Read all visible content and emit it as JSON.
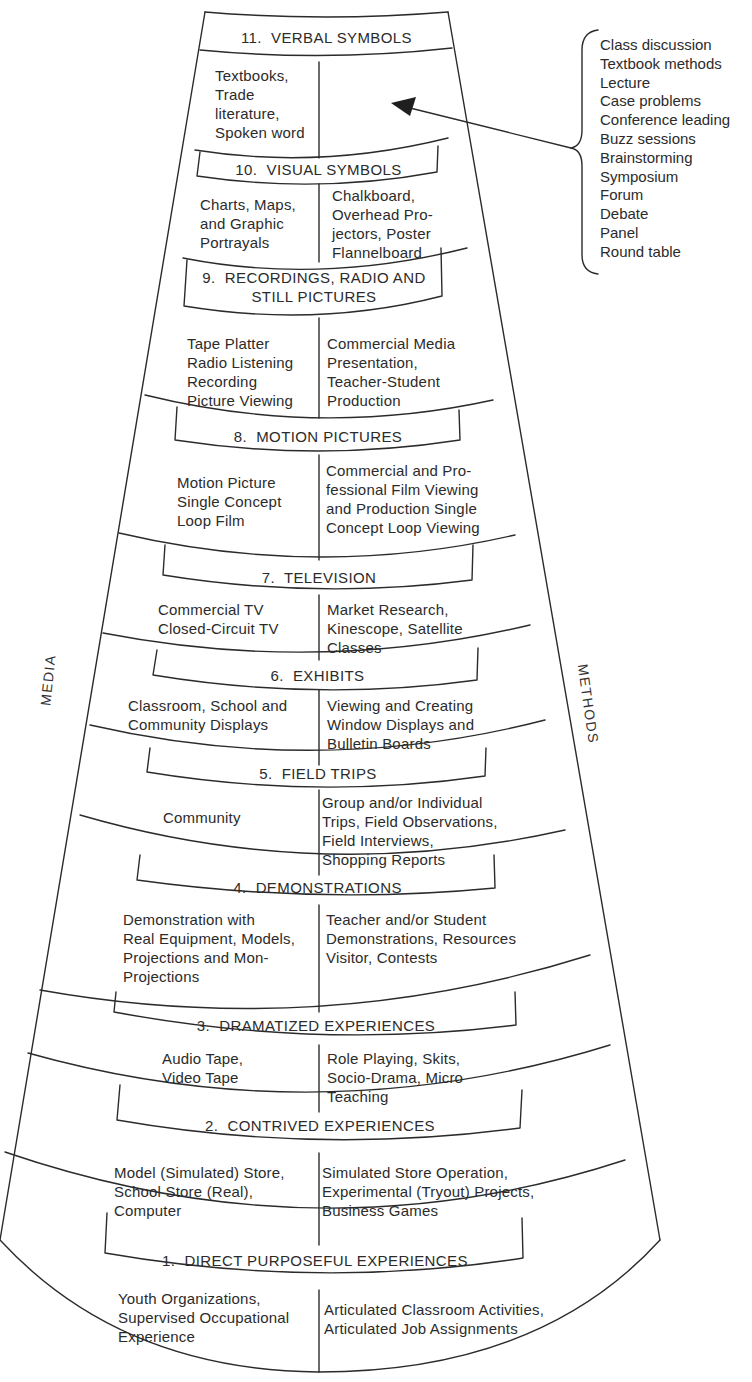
{
  "side_labels": {
    "left": "MEDIA",
    "right": "METHODS"
  },
  "verbal_methods": [
    "Class discussion",
    "Textbook methods",
    "Lecture",
    "Case problems",
    "Conference leading",
    "Buzz sessions",
    "Brainstorming",
    "Symposium",
    "Forum",
    "Debate",
    "Panel",
    "Round table"
  ],
  "levels": {
    "l11": {
      "title": "11.  VERBAL SYMBOLS",
      "media": "Textbooks,\nTrade\nliterature,\nSpoken word",
      "methods": ""
    },
    "l10": {
      "title": "10.  VISUAL SYMBOLS",
      "media": "Charts, Maps,\nand Graphic\nPortrayals",
      "methods": "Chalkboard,\nOverhead Pro-\njectors, Poster\nFlannelboard"
    },
    "l9": {
      "title": "9.  RECORDINGS, RADIO AND\nSTILL PICTURES",
      "media": "Tape Platter\nRadio Listening\nRecording\nPicture Viewing",
      "methods": "Commercial Media\nPresentation,\nTeacher-Student\nProduction"
    },
    "l8": {
      "title": "8.  MOTION PICTURES",
      "media": "Motion Picture\nSingle Concept\nLoop Film",
      "methods": "Commercial and Pro-\nfessional Film Viewing\nand Production Single\nConcept Loop Viewing"
    },
    "l7": {
      "title": "7.  TELEVISION",
      "media": "Commercial TV\nClosed-Circuit TV",
      "methods": "Market Research,\nKinescope, Satellite\nClasses"
    },
    "l6": {
      "title": "6.  EXHIBITS",
      "media": "Classroom, School and\nCommunity Displays",
      "methods": "Viewing and Creating\nWindow Displays and\nBulletin Boards"
    },
    "l5": {
      "title": "5.  FIELD TRIPS",
      "media": "Community",
      "methods": "Group and/or Individual\nTrips, Field Observations,\nField Interviews,\nShopping Reports"
    },
    "l4": {
      "title": "4.  DEMONSTRATIONS",
      "media": "Demonstration with\nReal Equipment, Models,\nProjections and Mon-\nProjections",
      "methods": "Teacher and/or Student\nDemonstrations, Resources\nVisitor, Contests"
    },
    "l3": {
      "title": "3.  DRAMATIZED EXPERIENCES",
      "media": "Audio Tape,\nVideo Tape",
      "methods": "Role Playing, Skits,\nSocio-Drama, Micro\nTeaching"
    },
    "l2": {
      "title": "2.  CONTRIVED EXPERIENCES",
      "media": "Model (Simulated) Store,\nSchool Store (Real),\nComputer",
      "methods": "Simulated Store Operation,\nExperimental (Tryout) Projects,\nBusiness Games"
    },
    "l1": {
      "title": "1.  DIRECT PURPOSEFUL EXPERIENCES",
      "media": "Youth Organizations,\nSupervised Occupational\nExperience",
      "methods": "Articulated Classroom Activities,\nArticulated Job Assignments"
    }
  },
  "colors": {
    "ink": "#2b2b2b",
    "paper": "#ffffff"
  }
}
